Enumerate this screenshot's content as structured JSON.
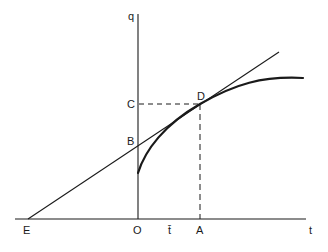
{
  "diagram": {
    "type": "tangent-construction",
    "background": "#ffffff",
    "line_color": "#1a1a1a",
    "axes": {
      "vertical": {
        "label": "q",
        "x": 138,
        "y_top": 14,
        "y_bottom": 219
      },
      "horizontal": {
        "label": "t",
        "y": 219,
        "x_left": 15,
        "x_right": 306
      }
    },
    "points": {
      "O": {
        "label": "O",
        "x": 138,
        "y": 219
      },
      "E": {
        "label": "E",
        "x": 28,
        "y": 219
      },
      "B": {
        "label": "B",
        "x": 138,
        "y": 146
      },
      "C": {
        "label": "C",
        "x": 138,
        "y": 104
      },
      "D": {
        "label": "D",
        "x": 200,
        "y": 104
      },
      "A": {
        "label": "A",
        "x": 200,
        "y": 219
      },
      "t_bar": {
        "label": "t̄",
        "x": 171,
        "y": 219
      }
    },
    "curve": {
      "description": "concave increasing curve starting on q-axis below B, tangent to line at D, flattening to the right",
      "start": [
        138,
        173
      ],
      "end": [
        303,
        78
      ]
    },
    "tangent_line": {
      "description": "straight line from E through B and D",
      "from": [
        28,
        219
      ],
      "to": [
        279,
        52
      ]
    },
    "dashed_lines": [
      {
        "from": "C",
        "to": "D"
      },
      {
        "from": "D",
        "to": "A"
      }
    ],
    "labels": {
      "q": "q",
      "t": "t",
      "O": "O",
      "E": "E",
      "B": "B",
      "C": "C",
      "D": "D",
      "A": "A",
      "t_bar": "t̄"
    }
  }
}
